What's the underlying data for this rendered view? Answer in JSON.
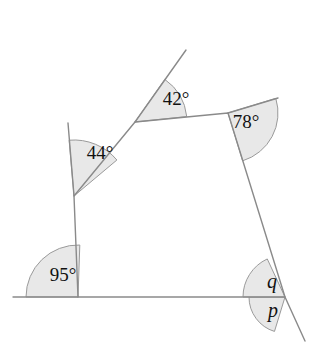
{
  "figure": {
    "type": "geometry-diagram",
    "background_color": "#ffffff",
    "stroke_color": "#8a8a8a",
    "sector_fill_color": "#e8e8e8",
    "sector_stroke_color": "#9a9a9a",
    "text_color": "#111111",
    "width": 319,
    "height": 364
  },
  "shape": {
    "name": "quadrilateral",
    "vertices": [
      {
        "name": "top-left-vertex",
        "x": 135,
        "y": 122
      },
      {
        "name": "top-right-vertex",
        "x": 228,
        "y": 113
      },
      {
        "name": "bottom-right-vertex",
        "x": 285,
        "y": 297
      },
      {
        "name": "bottom-left-vertex",
        "x": 78,
        "y": 297
      },
      {
        "name": "left-bend-vertex",
        "x": 74,
        "y": 196
      }
    ],
    "rays": [
      {
        "name": "ray-upper-left-diagonal",
        "from_x": 135,
        "from_y": 122,
        "to_x": 186,
        "to_y": 50
      },
      {
        "name": "ray-left-side-up",
        "from_x": 74,
        "from_y": 196,
        "to_x": 68,
        "to_y": 123
      },
      {
        "name": "ray-top-right-extension",
        "from_x": 228,
        "from_y": 113,
        "to_x": 278,
        "to_y": 98
      },
      {
        "name": "ray-bottom-left-horizontal",
        "from_x": 78,
        "from_y": 297,
        "to_x": 13,
        "to_y": 297
      },
      {
        "name": "ray-bottom-right-extension",
        "from_x": 285,
        "from_y": 297,
        "to_x": 305,
        "to_y": 341
      }
    ]
  },
  "angles": [
    {
      "id": "angle-44",
      "label": "44°",
      "value": 44,
      "unit": "degrees",
      "known": true,
      "label_x": 100,
      "label_y": 155,
      "vertex_x": 74,
      "vertex_y": 196,
      "radius": 56,
      "start_deg": 265,
      "end_deg": 320
    },
    {
      "id": "angle-42",
      "label": "42°",
      "value": 42,
      "unit": "degrees",
      "known": true,
      "label_x": 176,
      "label_y": 101,
      "vertex_x": 135,
      "vertex_y": 122,
      "radius": 52,
      "start_deg": 305,
      "end_deg": 354
    },
    {
      "id": "angle-78",
      "label": "78°",
      "value": 78,
      "unit": "degrees",
      "known": true,
      "label_x": 246,
      "label_y": 124,
      "vertex_x": 228,
      "vertex_y": 113,
      "radius": 50,
      "start_deg": 343,
      "end_deg": 73
    },
    {
      "id": "angle-95",
      "label": "95°",
      "value": 95,
      "unit": "degrees",
      "known": true,
      "label_x": 63,
      "label_y": 277,
      "vertex_x": 78,
      "vertex_y": 297,
      "radius": 52,
      "start_deg": 180,
      "end_deg": 272
    },
    {
      "id": "angle-q",
      "label": "q",
      "value": null,
      "unit": "degrees",
      "known": false,
      "label_x": 272,
      "label_y": 283,
      "vertex_x": 285,
      "vertex_y": 297,
      "radius": 36,
      "start_deg": 107,
      "end_deg": 180
    },
    {
      "id": "angle-p",
      "label": "p",
      "value": null,
      "unit": "degrees",
      "known": false,
      "label_x": 273,
      "label_y": 312,
      "vertex_x": 285,
      "vertex_y": 297,
      "radius": 42,
      "start_deg": 180,
      "end_deg": 245
    }
  ]
}
